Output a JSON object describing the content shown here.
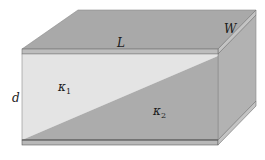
{
  "diagram": {
    "type": "capacitor-dielectric-wedge",
    "labels": {
      "length": "L",
      "width": "W",
      "separation": "d",
      "kappa1": "κ",
      "kappa1_sub": "1",
      "kappa2": "κ",
      "kappa2_sub": "2"
    },
    "colors": {
      "plate_top": "#a9a9a9",
      "plate_edge": "#bdbdbd",
      "side_face": "#b2b2b2",
      "dielectric1": "#e4e4e4",
      "dielectric2": "#acacac",
      "outline": "#6e6e6e"
    }
  }
}
